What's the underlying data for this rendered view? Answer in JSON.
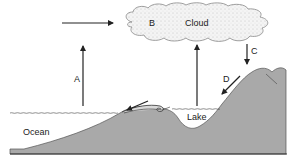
{
  "diagram": {
    "type": "water-cycle",
    "labels": {
      "a": "A",
      "b": "B",
      "c": "C",
      "d": "D",
      "cloud": "Cloud",
      "lake": "Lake",
      "ocean": "Ocean"
    },
    "colors": {
      "ground": "#a9a9a9",
      "ground_edge": "#555555",
      "arrow": "#222222",
      "cloud_fill": "#f2f2f2",
      "cloud_edge": "#888888",
      "water_line": "#444444",
      "background": "#ffffff"
    }
  }
}
